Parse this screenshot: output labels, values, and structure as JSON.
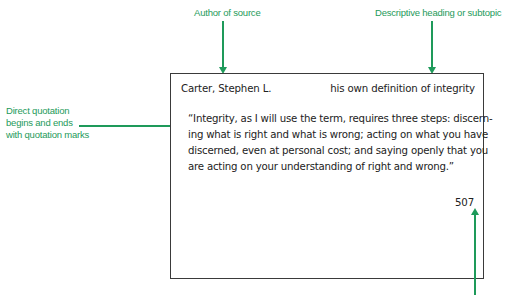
{
  "annotations": {
    "author_label": "Author of source",
    "heading_label": "Descriptive heading or subtopic",
    "quotation_label_lines": [
      "Direct quotation",
      "begins and ends",
      "with quotation marks"
    ]
  },
  "card": {
    "author": "Carter, Stephen L.",
    "heading": "his own definition of integrity",
    "quote_lines": [
      "“Integrity, as I will use the term, requires three steps: discern-",
      "ing what is right and what is wrong; acting on what you have",
      "discerned, even at personal cost; and saying openly that you",
      "are acting on your understanding of right and wrong.”"
    ],
    "page_number": "507"
  },
  "colors": {
    "accent": "#1e9a5a",
    "card_border": "#3a3a3a",
    "text": "#222222"
  }
}
